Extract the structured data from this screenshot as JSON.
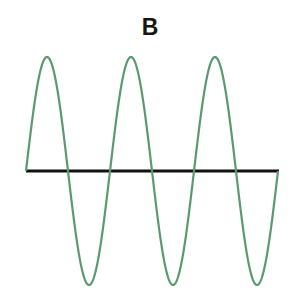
{
  "title": "B",
  "colors": {
    "wave": "#5a9a6e",
    "axis": "#111111",
    "background": "#ffffff"
  },
  "chart_data": {
    "type": "line",
    "title": "B",
    "xlabel": "",
    "ylabel": "",
    "grid": false,
    "series": [
      {
        "name": "sine wave",
        "shape": "sine",
        "cycles": 3,
        "start_phase": "zero, rising",
        "amplitude": 1
      }
    ],
    "axis": {
      "horizontal_baseline": true,
      "y": 0
    }
  },
  "geometry": {
    "x_start": 26,
    "x_end": 278,
    "baseline_y": 171,
    "amplitude_px": 114,
    "cycles": 3
  }
}
